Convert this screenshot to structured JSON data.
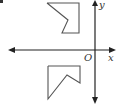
{
  "diagram": {
    "type": "coordinate-plane-reflection",
    "axes": {
      "x_label": "x",
      "y_label": "y",
      "origin_label": "O",
      "color": "#222222"
    },
    "shapes": [
      {
        "name": "upper-shape",
        "stroke": "#555555",
        "points": "47,3 79,3 79,33 62,33 68,20 47,3"
      },
      {
        "name": "lower-shape",
        "stroke": "#555555",
        "points": "48,66 80,66 80,83 67,75 48,99 48,66"
      }
    ]
  }
}
